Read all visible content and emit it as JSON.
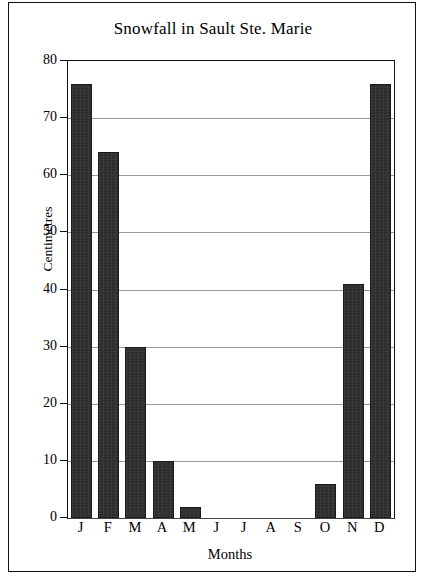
{
  "chart_data": {
    "type": "bar",
    "title": "Snowfall in Sault Ste. Marie",
    "xlabel": "Months",
    "ylabel": "Centimetres",
    "categories": [
      "J",
      "F",
      "M",
      "A",
      "M",
      "J",
      "J",
      "A",
      "S",
      "O",
      "N",
      "D"
    ],
    "values": [
      76,
      64,
      30,
      10,
      2,
      0,
      0,
      0,
      0,
      6,
      41,
      76
    ],
    "ylim": [
      0,
      80
    ],
    "yticks": [
      0,
      10,
      20,
      30,
      40,
      50,
      60,
      70,
      80
    ],
    "ytick_labels": [
      "0",
      "10",
      "20",
      "30",
      "40",
      "50",
      "60",
      "70",
      "80"
    ],
    "grid": true,
    "legend": false,
    "bar_color": "#2d2d2d",
    "grid_color": "#9a9a9a",
    "axis_color": "#111111",
    "background": "#ffffff"
  }
}
